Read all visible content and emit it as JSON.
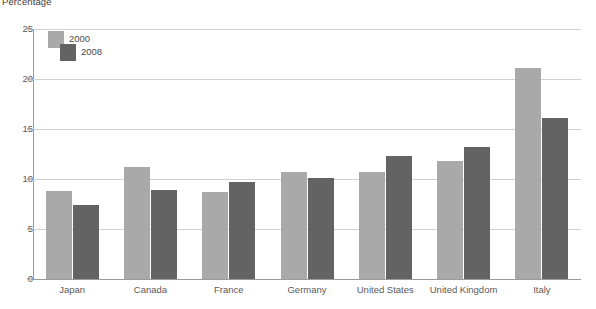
{
  "chart_data": {
    "type": "bar",
    "title": "Percentage",
    "xlabel": "",
    "ylabel": "",
    "ylim": [
      0,
      25
    ],
    "ytick_step": 5,
    "yticks": [
      0,
      5,
      10,
      15,
      20,
      25
    ],
    "grid": true,
    "legend_position": "top-left-inside",
    "categories": [
      "Japan",
      "Canada",
      "France",
      "Germany",
      "United States",
      "United Kingdom",
      "Italy"
    ],
    "series": [
      {
        "name": "2000",
        "color": "#a9a9a9",
        "values": [
          8.8,
          11.2,
          8.7,
          10.7,
          10.7,
          11.8,
          21.1
        ]
      },
      {
        "name": "2008",
        "color": "#636363",
        "values": [
          7.4,
          8.9,
          9.7,
          10.1,
          12.3,
          13.2,
          16.1
        ]
      }
    ]
  },
  "legend": {
    "items": [
      {
        "label": "2000"
      },
      {
        "label": "2008"
      }
    ]
  }
}
